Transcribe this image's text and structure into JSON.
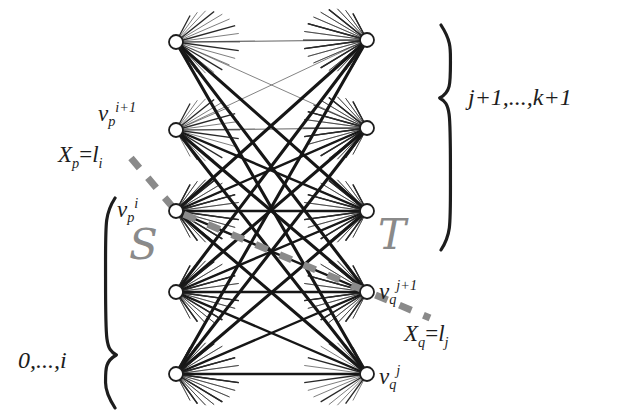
{
  "figure": {
    "kind": "bipartite-graph-diagram",
    "background_color": "#ffffff",
    "edge_color": "#1d1d1d",
    "node_stroke_color": "#1d1d1d",
    "node_fill_color": "#ffffff",
    "highlight_color": "#8a8a8a",
    "brace_color": "#1d1d1d"
  },
  "labels": {
    "v_p_i_plus_1": {
      "base": "v",
      "sub": "p",
      "sup": "i+1"
    },
    "v_p_i": {
      "base": "v",
      "sub": "p",
      "sup": "i"
    },
    "v_q_j_plus_1": {
      "base": "v",
      "sub": "q",
      "sup": "j+1"
    },
    "v_q_j": {
      "base": "v",
      "sub": "q",
      "sup": "j"
    },
    "x_p_equation": {
      "lhs": "X",
      "lhs_sub": "p",
      "eq": "=",
      "rhs": "l",
      "rhs_sub": "i"
    },
    "x_q_equation": {
      "lhs": "X",
      "lhs_sub": "q",
      "eq": "=",
      "rhs": "l",
      "rhs_sub": "j"
    },
    "set_s": "S",
    "set_t": "T",
    "range_left": "0,...,i",
    "range_right": "j+1,...,k+1"
  },
  "nodes": {
    "left_column": [
      {
        "id": "L1",
        "cx": 176,
        "cy": 42
      },
      {
        "id": "L2",
        "cx": 176,
        "cy": 130
      },
      {
        "id": "L3",
        "cx": 176,
        "cy": 211
      },
      {
        "id": "L4",
        "cx": 176,
        "cy": 292
      },
      {
        "id": "L5",
        "cx": 176,
        "cy": 374
      }
    ],
    "right_column": [
      {
        "id": "R1",
        "cx": 367,
        "cy": 40
      },
      {
        "id": "R2",
        "cx": 367,
        "cy": 128
      },
      {
        "id": "R3",
        "cx": 367,
        "cy": 211
      },
      {
        "id": "R4",
        "cx": 367,
        "cy": 292
      },
      {
        "id": "R5",
        "cx": 367,
        "cy": 374
      }
    ],
    "radius": 7
  },
  "dashed_path": {
    "color": "#8a8a8a",
    "from": {
      "x": 131,
      "y": 158
    },
    "via": {
      "x": 176,
      "y": 211
    },
    "to": {
      "x": 430,
      "y": 318
    }
  },
  "braces": {
    "left": {
      "x": 104,
      "y_top": 198,
      "y_bottom": 408,
      "notch_y": 355
    },
    "right": {
      "x": 452,
      "y_top": 25,
      "y_bottom": 250,
      "notch_y": 98
    }
  },
  "chart_data": {
    "type": "diagram",
    "left_nodes": 5,
    "right_nodes": 5,
    "edges": "complete bipartite (all left nodes joined to all right nodes), rendered with mixed stroke weights"
  }
}
